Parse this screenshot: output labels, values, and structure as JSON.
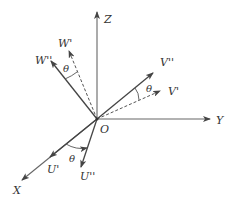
{
  "diagram": {
    "colors": {
      "line": "#555555",
      "text": "#333333",
      "background": "#ffffff"
    },
    "origin": {
      "label": "O"
    },
    "axes": [
      {
        "id": "X",
        "label": "X"
      },
      {
        "id": "Y",
        "label": "Y"
      },
      {
        "id": "Z",
        "label": "Z"
      }
    ],
    "vectors": [
      {
        "id": "U1",
        "label": "U'",
        "style": "solid"
      },
      {
        "id": "U2",
        "label": "U''",
        "style": "solid"
      },
      {
        "id": "V1",
        "label": "V'",
        "style": "dashed"
      },
      {
        "id": "V2",
        "label": "V''",
        "style": "solid"
      },
      {
        "id": "W1",
        "label": "W'",
        "style": "dashed"
      },
      {
        "id": "W2",
        "label": "W''",
        "style": "solid"
      }
    ],
    "angles": [
      {
        "id": "theta-w",
        "label": "θ",
        "between": [
          "W'",
          "W''"
        ]
      },
      {
        "id": "theta-v",
        "label": "θ",
        "between": [
          "V'",
          "V''"
        ]
      },
      {
        "id": "theta-u",
        "label": "θ",
        "between": [
          "U'",
          "U''"
        ]
      }
    ]
  }
}
